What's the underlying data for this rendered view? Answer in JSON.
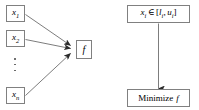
{
  "diagram": {
    "left_panel": {
      "inputs": [
        {
          "label": "x",
          "subscript": "1",
          "full": "x₁"
        },
        {
          "label": "x",
          "subscript": "2",
          "full": "x₂"
        },
        {
          "label": "x",
          "subscript": "n",
          "full": "xₙ"
        }
      ],
      "ellipsis": "⋮",
      "function_node": {
        "label": "f"
      },
      "edges": [
        {
          "from": "x1",
          "to": "f"
        },
        {
          "from": "x2",
          "to": "f"
        },
        {
          "from": "xn",
          "to": "f"
        }
      ]
    },
    "right_panel": {
      "constraint_box": {
        "variable": "x",
        "variable_subscript": "i",
        "membership": "∈",
        "open_bracket": "[",
        "lower": "l",
        "lower_subscript": "i",
        "comma": ",",
        "upper": "u",
        "upper_subscript": "i",
        "close_bracket": "]"
      },
      "objective_box": {
        "verb": "Minimize",
        "function": "f"
      },
      "edges": [
        {
          "from": "constraint_box",
          "to": "objective_box"
        }
      ]
    },
    "colors": {
      "box_border": "#808080",
      "arrow": "#555555",
      "text": "#000000",
      "background": "#ffffff"
    }
  }
}
